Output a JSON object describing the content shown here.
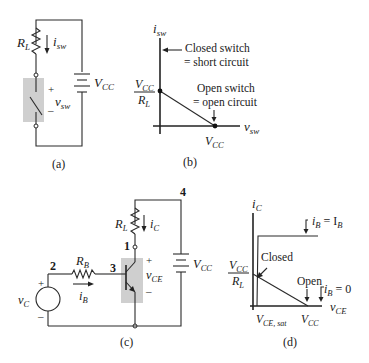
{
  "panels": {
    "a": {
      "caption": "(a)",
      "labels": {
        "resistor": "R",
        "resistor_sub": "L",
        "current": "i",
        "current_sub": "sw",
        "voltage": "v",
        "voltage_sub": "sw",
        "plus": "+",
        "minus": "–",
        "source": "V",
        "source_sub": "CC"
      }
    },
    "b": {
      "caption": "(b)",
      "y_axis": "i",
      "y_axis_sub": "sw",
      "x_axis": "v",
      "x_axis_sub": "sw",
      "y_intercept_num": "V",
      "y_intercept_num_sub": "CC",
      "y_intercept_den": "R",
      "y_intercept_den_sub": "L",
      "x_intercept": "V",
      "x_intercept_sub": "CC",
      "annotation_closed_1": "Closed switch",
      "annotation_closed_2": "= short circuit",
      "annotation_open_1": "Open switch",
      "annotation_open_2": "= open circuit"
    },
    "c": {
      "caption": "(c)",
      "labels": {
        "node1": "1",
        "node2": "2",
        "node3": "3",
        "node4": "4",
        "rl": "R",
        "rl_sub": "L",
        "ic": "i",
        "ic_sub": "C",
        "rb": "R",
        "rb_sub": "B",
        "ib": "i",
        "ib_sub": "B",
        "vc": "v",
        "vc_sub": "C",
        "vce": "v",
        "vce_sub": "CE",
        "vcc": "V",
        "vcc_sub": "CC",
        "plus": "+",
        "minus": "–"
      }
    },
    "d": {
      "caption": "(d)",
      "y_axis": "i",
      "y_axis_sub": "C",
      "x_axis": "v",
      "x_axis_sub": "CE",
      "y_intercept_num": "V",
      "y_intercept_num_sub": "CC",
      "y_intercept_den": "R",
      "y_intercept_den_sub": "L",
      "x_sat": "V",
      "x_sat_sub": "CE, sat",
      "x_vcc": "V",
      "x_vcc_sub": "CC",
      "closed": "Closed",
      "open": "Open",
      "ib_high": "i",
      "ib_high_sub": "B",
      "ib_high_eq": " = I",
      "ib_high_eq_sub": "B",
      "ib_zero": "i",
      "ib_zero_sub": "B",
      "ib_zero_eq": " = 0"
    }
  }
}
